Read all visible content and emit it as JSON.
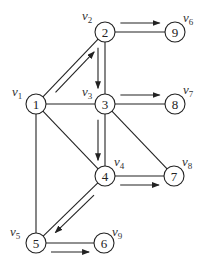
{
  "diagram": {
    "type": "directed-graph-with-highlighted-path",
    "nodes": [
      {
        "id": "1",
        "label": "1",
        "vertex": "v",
        "sub": "1",
        "x": 36,
        "y": 104,
        "lx": 12,
        "ly": 96
      },
      {
        "id": "2",
        "label": "2",
        "vertex": "v",
        "sub": "2",
        "x": 105,
        "y": 32,
        "lx": 82,
        "ly": 20
      },
      {
        "id": "3",
        "label": "3",
        "vertex": "v",
        "sub": "3",
        "x": 105,
        "y": 104,
        "lx": 82,
        "ly": 96
      },
      {
        "id": "4",
        "label": "4",
        "vertex": "v",
        "sub": "4",
        "x": 105,
        "y": 176,
        "lx": 114,
        "ly": 166
      },
      {
        "id": "5",
        "label": "5",
        "vertex": "v",
        "sub": "5",
        "x": 36,
        "y": 243,
        "lx": 10,
        "ly": 236
      },
      {
        "id": "6",
        "label": "6",
        "vertex": "v",
        "sub": "9",
        "x": 104,
        "y": 243,
        "lx": 112,
        "ly": 236
      },
      {
        "id": "7",
        "label": "7",
        "vertex": "v",
        "sub": "8",
        "x": 174,
        "y": 176,
        "lx": 182,
        "ly": 166
      },
      {
        "id": "8",
        "label": "8",
        "vertex": "v",
        "sub": "7",
        "x": 175,
        "y": 104,
        "lx": 183,
        "ly": 94
      },
      {
        "id": "9",
        "label": "9",
        "vertex": "v",
        "sub": "6",
        "x": 175,
        "y": 32,
        "lx": 183,
        "ly": 22
      }
    ],
    "edges": [
      {
        "from": "1",
        "to": "2",
        "arrow": true
      },
      {
        "from": "1",
        "to": "3",
        "arrow": false
      },
      {
        "from": "1",
        "to": "4",
        "arrow": false
      },
      {
        "from": "1",
        "to": "5",
        "arrow": false
      },
      {
        "from": "2",
        "to": "9",
        "arrow": true
      },
      {
        "from": "2",
        "to": "3",
        "arrow": true
      },
      {
        "from": "3",
        "to": "8",
        "arrow": true
      },
      {
        "from": "3",
        "to": "4",
        "arrow": true
      },
      {
        "from": "3",
        "to": "7",
        "arrow": false
      },
      {
        "from": "4",
        "to": "7",
        "arrow": true
      },
      {
        "from": "4",
        "to": "5",
        "arrow": true
      },
      {
        "from": "5",
        "to": "6",
        "arrow": true
      }
    ]
  }
}
